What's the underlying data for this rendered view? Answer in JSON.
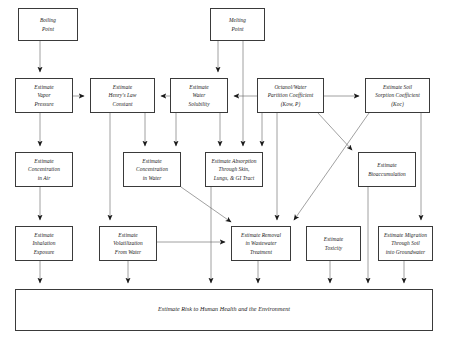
{
  "diagram": {
    "title": "Estimate Risk to Human Health and the Environment",
    "type": "flowchart",
    "style": {
      "background": "#ffffff",
      "box_border": "#3a3a3a",
      "line_color": "#6e6e6e",
      "text_color": "#1a1a1a"
    },
    "nodes": [
      {
        "id": "boiling_point",
        "label": "Boiling\nPoint",
        "x": 18,
        "y": 8,
        "w": 60,
        "h": 33
      },
      {
        "id": "melting_point",
        "label": "Melting\nPoint",
        "x": 210,
        "y": 8,
        "w": 55,
        "h": 33
      },
      {
        "id": "vapor_pressure",
        "label": "Estimate\nVapor\nPressure",
        "x": 15,
        "y": 78,
        "w": 58,
        "h": 35
      },
      {
        "id": "henrys_law",
        "label": "Estimate\nHenry's Law\nConstant",
        "x": 90,
        "y": 78,
        "w": 65,
        "h": 35
      },
      {
        "id": "water_solubility",
        "label": "Estimate\nWater\nSolubility",
        "x": 170,
        "y": 78,
        "w": 58,
        "h": 35
      },
      {
        "id": "octanol_water",
        "label": "Octanol/Water\nPartition Coefficient\n(Kow, P)",
        "x": 257,
        "y": 78,
        "w": 67,
        "h": 35
      },
      {
        "id": "soil_sorption",
        "label": "Estimate Soil\nSorption Coefficient\n(Koc)",
        "x": 365,
        "y": 78,
        "w": 65,
        "h": 35
      },
      {
        "id": "conc_air",
        "label": "Estimate\nConcentration\nin Air",
        "x": 15,
        "y": 152,
        "w": 58,
        "h": 35
      },
      {
        "id": "conc_water",
        "label": "Estimate\nConcentration\nin Water",
        "x": 123,
        "y": 152,
        "w": 58,
        "h": 35
      },
      {
        "id": "absorption",
        "label": "Estimate Absorption\nThrough Skin,\nLungs, & GI Tract",
        "x": 205,
        "y": 152,
        "w": 58,
        "h": 35
      },
      {
        "id": "bioaccumulation",
        "label": "Estimate\nBioaccumulation",
        "x": 358,
        "y": 152,
        "w": 58,
        "h": 35
      },
      {
        "id": "inhalation",
        "label": "Estimate\nInhalation\nExposure",
        "x": 15,
        "y": 226,
        "w": 58,
        "h": 35
      },
      {
        "id": "volatilization",
        "label": "Estimate\nVolatilization\nFrom Water",
        "x": 99,
        "y": 226,
        "w": 58,
        "h": 35
      },
      {
        "id": "wastewater",
        "label": "Estimate Removal\nin Wastewater\nTreatment",
        "x": 231,
        "y": 226,
        "w": 60,
        "h": 35
      },
      {
        "id": "toxicity",
        "label": "Estimate\nToxicity",
        "x": 306,
        "y": 226,
        "w": 55,
        "h": 35
      },
      {
        "id": "migration",
        "label": "Estimate Migration\nThrough Soil\ninto Groundwater",
        "x": 378,
        "y": 226,
        "w": 55,
        "h": 35
      },
      {
        "id": "risk_summary",
        "label": "Estimate Risk to Human Health and the Environment",
        "x": 15,
        "y": 289,
        "w": 418,
        "h": 42
      }
    ],
    "edges": [
      {
        "from": "boiling_point",
        "to": "vapor_pressure",
        "kind": "vertical"
      },
      {
        "from": "vapor_pressure",
        "to": "henrys_law",
        "kind": "horizontal"
      },
      {
        "from": "water_solubility",
        "to": "henrys_law",
        "kind": "horizontal-left"
      },
      {
        "from": "melting_point",
        "to": "water_solubility",
        "kind": "vertical"
      },
      {
        "from": "melting_point",
        "to": "absorption",
        "kind": "vertical-long"
      },
      {
        "from": "octanol_water",
        "to": "water_solubility",
        "kind": "horizontal-left"
      },
      {
        "from": "octanol_water",
        "to": "soil_sorption",
        "kind": "horizontal"
      },
      {
        "from": "vapor_pressure",
        "to": "conc_air",
        "kind": "vertical"
      },
      {
        "from": "conc_air",
        "to": "inhalation",
        "kind": "vertical"
      },
      {
        "from": "inhalation",
        "to": "risk_summary",
        "kind": "vertical"
      },
      {
        "from": "henrys_law",
        "to": "conc_water",
        "kind": "vertical"
      },
      {
        "from": "henrys_law",
        "to": "volatilization",
        "kind": "vertical-long"
      },
      {
        "from": "water_solubility",
        "to": "conc_water",
        "kind": "vertical"
      },
      {
        "from": "water_solubility",
        "to": "absorption",
        "kind": "vertical"
      },
      {
        "from": "octanol_water",
        "to": "absorption",
        "kind": "vertical"
      },
      {
        "from": "octanol_water",
        "to": "wastewater",
        "kind": "vertical-long"
      },
      {
        "from": "octanol_water",
        "to": "bioaccumulation",
        "kind": "diagonal-down-right"
      },
      {
        "from": "soil_sorption",
        "to": "wastewater",
        "kind": "diagonal-down-left"
      },
      {
        "from": "soil_sorption",
        "to": "migration",
        "kind": "vertical-long"
      },
      {
        "from": "conc_water",
        "to": "wastewater",
        "kind": "diagonal-down-right"
      },
      {
        "from": "absorption",
        "to": "risk_summary",
        "kind": "vertical-long"
      },
      {
        "from": "volatilization",
        "to": "wastewater",
        "kind": "horizontal"
      },
      {
        "from": "volatilization",
        "to": "risk_summary",
        "kind": "vertical"
      },
      {
        "from": "wastewater",
        "to": "risk_summary",
        "kind": "vertical"
      },
      {
        "from": "toxicity",
        "to": "risk_summary",
        "kind": "vertical"
      },
      {
        "from": "bioaccumulation",
        "to": "risk_summary",
        "kind": "vertical-long"
      },
      {
        "from": "migration",
        "to": "risk_summary",
        "kind": "vertical"
      }
    ]
  }
}
